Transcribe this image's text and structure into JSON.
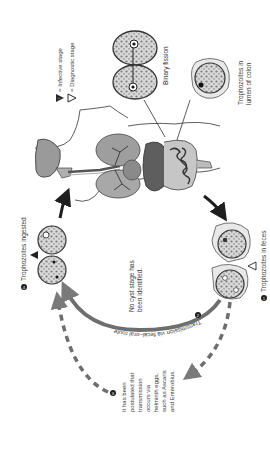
{
  "diagram": {
    "orientation": "rotated 90° counterclockwise",
    "legend": {
      "infective": "= Infective stage",
      "diagnostic": "= Diagnostic stage",
      "infective_symbol": "i",
      "diagnostic_symbol": "d"
    },
    "labels": {
      "binary_fission": "Binary fission",
      "lumen_line1": "Trophozoites in",
      "lumen_line2": "lumen of colon",
      "ingested": "Trophozoites ingested",
      "feces": "Trophozoites in feces",
      "fecal_oral": "Transmission via fecal–oral route",
      "no_cyst_line1": "No cyst stage has",
      "no_cyst_line2": "been identified.",
      "postulated_lines": [
        "It has been",
        "postulated that",
        "transmission",
        "occurs via",
        "helminth eggs,",
        "such as Ascaris",
        "and Enterobius."
      ]
    },
    "step_numbers": {
      "step1": "1",
      "step2": "2",
      "step3": "3",
      "step4": "4"
    },
    "colors": {
      "organ_light": "#b9b9b9",
      "organ_mid": "#8f8f8f",
      "organ_dark": "#5e5e5e",
      "arrow_dark": "#1e1e1e",
      "arrow_gray": "#7a7a7a",
      "text": "#3a3a3a"
    }
  }
}
